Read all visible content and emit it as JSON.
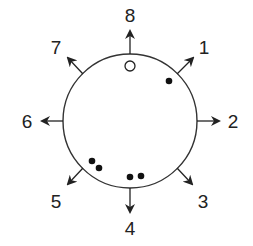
{
  "diagram": {
    "type": "circular-direction-diagram",
    "colors": {
      "stroke": "#333333",
      "text": "#222222",
      "dot_fill": "#111111",
      "hollow_fill": "#ffffff",
      "background": "#ffffff"
    },
    "circle": {
      "cx": 130,
      "cy": 121,
      "r": 67
    },
    "directions": [
      {
        "id": "1",
        "label": "1",
        "angle_deg": 45
      },
      {
        "id": "2",
        "label": "2",
        "angle_deg": 90
      },
      {
        "id": "3",
        "label": "3",
        "angle_deg": 135
      },
      {
        "id": "4",
        "label": "4",
        "angle_deg": 180
      },
      {
        "id": "5",
        "label": "5",
        "angle_deg": 225
      },
      {
        "id": "6",
        "label": "6",
        "angle_deg": 270
      },
      {
        "id": "7",
        "label": "7",
        "angle_deg": 315
      },
      {
        "id": "8",
        "label": "8",
        "angle_deg": 0
      }
    ],
    "markers": [
      {
        "type": "hollow",
        "near_direction": "8",
        "x": 130,
        "y": 66
      },
      {
        "type": "filled",
        "near_direction": "1",
        "x": 169,
        "y": 81
      },
      {
        "type": "filled",
        "near_direction": "5",
        "x": 92,
        "y": 161
      },
      {
        "type": "filled",
        "near_direction": "5",
        "x": 99,
        "y": 168
      },
      {
        "type": "filled",
        "near_direction": "4",
        "x": 130,
        "y": 177
      },
      {
        "type": "filled",
        "near_direction": "4",
        "x": 140,
        "y": 176
      }
    ]
  }
}
